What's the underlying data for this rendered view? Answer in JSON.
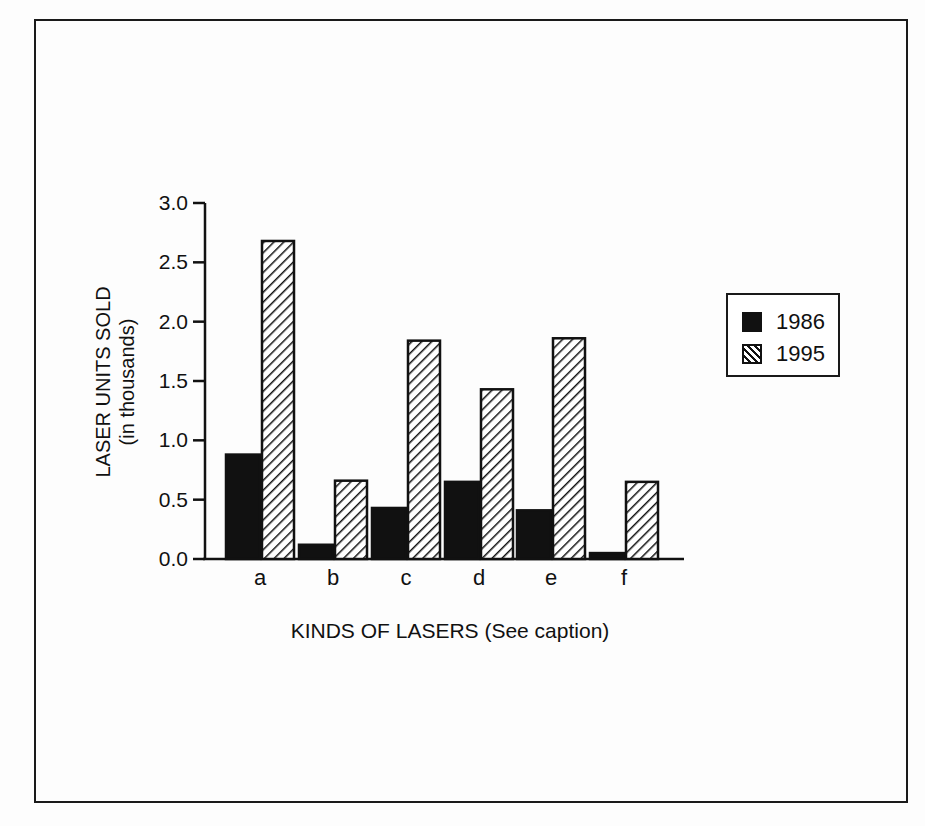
{
  "chart_data": {
    "type": "bar",
    "title": "",
    "xlabel": "KINDS OF LASERS (See caption)",
    "ylabel": "LASER UNITS SOLD",
    "ylabel_sub": "(in thousands)",
    "categories": [
      "a",
      "b",
      "c",
      "d",
      "e",
      "f"
    ],
    "series": [
      {
        "name": "1986",
        "pattern": "solid",
        "values": [
          0.88,
          0.12,
          0.43,
          0.65,
          0.41,
          0.05
        ]
      },
      {
        "name": "1995",
        "pattern": "hatched",
        "values": [
          2.68,
          0.66,
          1.84,
          1.43,
          1.86,
          0.65
        ]
      }
    ],
    "ylim": [
      0.0,
      3.0
    ],
    "yticks": [
      "0.0",
      "0.5",
      "1.0",
      "1.5",
      "2.0",
      "2.5",
      "3.0"
    ],
    "grid": false,
    "legend_position": "right"
  },
  "legend": {
    "items": [
      {
        "label": "1986"
      },
      {
        "label": "1995"
      }
    ]
  }
}
